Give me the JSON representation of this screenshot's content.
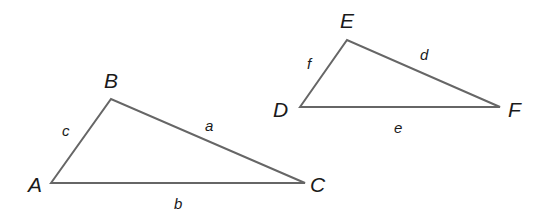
{
  "diagram": {
    "stroke_color": "#666666",
    "label_color": "#1a1a1a",
    "triangles": [
      {
        "name": "ABC",
        "vertices": [
          {
            "label": "A",
            "x": 51,
            "y": 183,
            "lx": 28,
            "ly": 192
          },
          {
            "label": "B",
            "x": 111,
            "y": 99,
            "lx": 104,
            "ly": 88
          },
          {
            "label": "C",
            "x": 305,
            "y": 183,
            "lx": 310,
            "ly": 192
          }
        ],
        "sides": [
          {
            "label": "c",
            "from": "A",
            "to": "B",
            "lx": 62,
            "ly": 136
          },
          {
            "label": "a",
            "from": "B",
            "to": "C",
            "lx": 205,
            "ly": 131
          },
          {
            "label": "b",
            "from": "A",
            "to": "C",
            "lx": 174,
            "ly": 209
          }
        ]
      },
      {
        "name": "DEF",
        "vertices": [
          {
            "label": "D",
            "x": 300,
            "y": 107,
            "lx": 273,
            "ly": 117
          },
          {
            "label": "E",
            "x": 347,
            "y": 40,
            "lx": 340,
            "ly": 28
          },
          {
            "label": "F",
            "x": 500,
            "y": 107,
            "lx": 508,
            "ly": 117
          }
        ],
        "sides": [
          {
            "label": "f",
            "from": "D",
            "to": "E",
            "lx": 307,
            "ly": 69
          },
          {
            "label": "d",
            "from": "E",
            "to": "F",
            "lx": 420,
            "ly": 60
          },
          {
            "label": "e",
            "from": "D",
            "to": "F",
            "lx": 394,
            "ly": 133
          }
        ]
      }
    ]
  },
  "labels": {
    "A": "A",
    "B": "B",
    "C": "C",
    "D": "D",
    "E": "E",
    "F": "F",
    "a": "a",
    "b": "b",
    "c": "c",
    "d": "d",
    "e": "e",
    "f": "f"
  }
}
